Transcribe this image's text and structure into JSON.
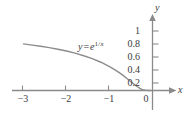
{
  "figure": {
    "background_color": "#ffffff",
    "axis_color": "#8a8a8a",
    "curve_color": "#8c8c8c",
    "text_color": "#3b3b3b"
  },
  "axes": {
    "x_axis_name": "x",
    "y_axis_name": "y"
  },
  "equation": {
    "lhs": "y",
    "operator": "=",
    "base": "e",
    "exponent_numerator": "1",
    "exponent_slash": "/",
    "exponent_denominator": "x",
    "plain": "y = e^(1/x)"
  },
  "chart_data": {
    "type": "line",
    "title": "",
    "subtitle": "",
    "xlabel": "x",
    "ylabel": "y",
    "legend": [],
    "legend_position": "none",
    "grid": false,
    "annotations": [
      {
        "text": "y = e^(1/x)",
        "x": -1.55,
        "y": 0.62
      }
    ],
    "xlim": [
      -3.3,
      0.55
    ],
    "ylim": [
      -0.12,
      1.18
    ],
    "xticks": [
      -3,
      -2,
      -1,
      0
    ],
    "xtick_labels": [
      "−3",
      "−2",
      "−1",
      "0"
    ],
    "yticks": [
      0.2,
      0.4,
      0.6,
      0.8,
      1
    ],
    "ytick_labels": [
      "0.2",
      "0.4",
      "0.6",
      "0.8",
      "1"
    ],
    "series": [
      {
        "name": "y = e^(1/x)",
        "x": [
          -3.0,
          -2.8,
          -2.6,
          -2.4,
          -2.2,
          -2.0,
          -1.8,
          -1.6,
          -1.4,
          -1.2,
          -1.0,
          -0.9,
          -0.8,
          -0.7,
          -0.6,
          -0.5,
          -0.45,
          -0.4,
          -0.35,
          -0.3,
          -0.25,
          -0.2,
          -0.15,
          -0.1,
          -0.05
        ],
        "y": [
          0.717,
          0.699,
          0.681,
          0.659,
          0.635,
          0.607,
          0.574,
          0.535,
          0.49,
          0.435,
          0.368,
          0.329,
          0.287,
          0.24,
          0.189,
          0.135,
          0.108,
          0.082,
          0.058,
          0.036,
          0.018,
          0.007,
          0.0013,
          4.54e-05,
          0.0
        ]
      }
    ]
  },
  "x_tick_labels": [
    {
      "label": "−3",
      "left": 14,
      "top": 94
    },
    {
      "label": "−2",
      "left": 57,
      "top": 94
    },
    {
      "label": "−1",
      "left": 100,
      "top": 94
    },
    {
      "label": "0",
      "left": 141,
      "top": 94
    }
  ],
  "y_tick_labels": [
    {
      "label": "1",
      "right": 51,
      "top": 26
    },
    {
      "label": "0.8",
      "right": 51,
      "top": 39
    },
    {
      "label": "0.6",
      "right": 51,
      "top": 52
    },
    {
      "label": "0.4",
      "right": 51,
      "top": 65
    },
    {
      "label": "0.2",
      "right": 51,
      "top": 78
    }
  ]
}
